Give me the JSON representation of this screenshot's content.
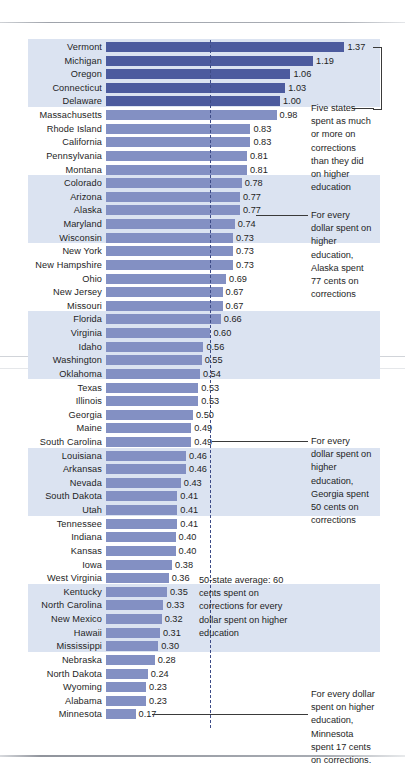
{
  "chart_data": {
    "type": "bar",
    "orientation": "horizontal",
    "title": "",
    "xlabel": "",
    "ylabel": "",
    "xlim": [
      0,
      1.45
    ],
    "grid": false,
    "legend": null,
    "reference_line": {
      "value": 0.6,
      "style": "dashed",
      "label": "50-state average: 60 cents"
    },
    "categories": [
      "Vermont",
      "Michigan",
      "Oregon",
      "Connecticut",
      "Delaware",
      "Massachusetts",
      "Rhode Island",
      "California",
      "Pennsylvania",
      "Montana",
      "Colorado",
      "Arizona",
      "Alaska",
      "Maryland",
      "Wisconsin",
      "New York",
      "New Hampshire",
      "Ohio",
      "New Jersey",
      "Missouri",
      "Florida",
      "Virginia",
      "Idaho",
      "Washington",
      "Oklahoma",
      "Texas",
      "Illinois",
      "Georgia",
      "Maine",
      "South Carolina",
      "Louisiana",
      "Arkansas",
      "Nevada",
      "South Dakota",
      "Utah",
      "Tennessee",
      "Indiana",
      "Kansas",
      "Iowa",
      "West Virginia",
      "Kentucky",
      "North Carolina",
      "New Mexico",
      "Hawaii",
      "Mississippi",
      "Nebraska",
      "North Dakota",
      "Wyoming",
      "Alabama",
      "Minnesota"
    ],
    "values": [
      1.37,
      1.19,
      1.06,
      1.03,
      1.0,
      0.98,
      0.83,
      0.83,
      0.81,
      0.81,
      0.78,
      0.77,
      0.77,
      0.74,
      0.73,
      0.73,
      0.73,
      0.69,
      0.67,
      0.67,
      0.66,
      0.6,
      0.56,
      0.55,
      0.54,
      0.53,
      0.53,
      0.5,
      0.49,
      0.49,
      0.46,
      0.46,
      0.43,
      0.41,
      0.41,
      0.41,
      0.4,
      0.4,
      0.38,
      0.36,
      0.35,
      0.33,
      0.32,
      0.31,
      0.3,
      0.28,
      0.24,
      0.23,
      0.23,
      0.17
    ],
    "value_labels": [
      "1.37",
      "1.19",
      "1.06",
      "1.03",
      "1.00",
      "0.98",
      "0.83",
      "0.83",
      "0.81",
      "0.81",
      "0.78",
      "0.77",
      "0.77",
      "0.74",
      "0.73",
      "0.73",
      "0.73",
      "0.69",
      "0.67",
      "0.67",
      "0.66",
      "0.60",
      "0.56",
      "0.55",
      "0.54",
      "0.53",
      "0.53",
      "0.50",
      "0.49",
      "0.49",
      "0.46",
      "0.46",
      "0.43",
      "0.41",
      "0.41",
      "0.41",
      "0.40",
      "0.40",
      "0.38",
      "0.36",
      "0.35",
      "0.33",
      "0.32",
      "0.31",
      "0.30",
      "0.28",
      "0.24",
      "0.23",
      "0.23",
      "0.17"
    ],
    "highlighted_indices": [
      0,
      1,
      2,
      3,
      4
    ],
    "colors": {
      "bar": "#8390c3",
      "bar_highlight": "#4c5b9e",
      "band": "#dbe3f1",
      "avg_line": "#3d4b87"
    }
  },
  "annotations": {
    "top_five": "Five states\nspent as much\nor more on\ncorrections\nthan they did\non higher\neducation",
    "alaska": "For every\ndollar spent on\nhigher\neducation,\nAlaska spent\n77 cents on\ncorrections",
    "georgia": "For every\ndollar spent on\nhigher\neducation,\nGeorgia spent\n50 cents on\ncorrections",
    "average": "50-state average: 60\ncents spent on\ncorrections for every\ndollar spent on higher\neducation",
    "minnesota": "For every dollar\nspent on higher\neducation,\nMinnesota\nspent 17 cents\non corrections."
  }
}
